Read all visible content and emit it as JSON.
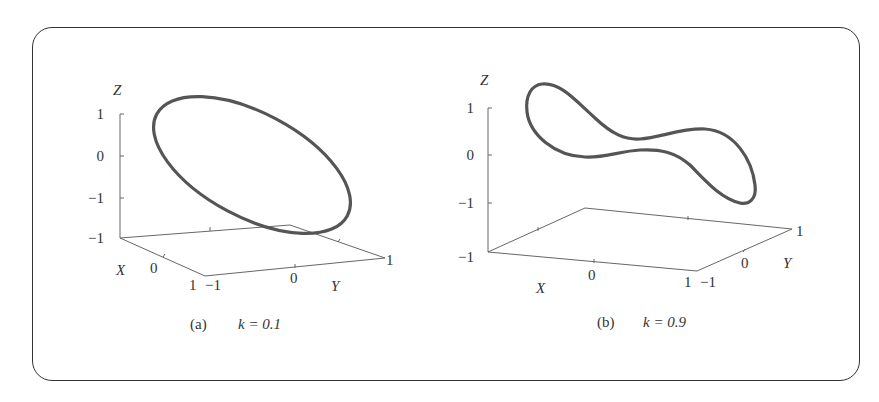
{
  "figure": {
    "panels": [
      {
        "id": "a",
        "caption_label": "(a)",
        "caption_param": "k = 0.1",
        "k": 0.1,
        "axes": {
          "x_label": "X",
          "y_label": "Y",
          "z_label": "Z",
          "z_ticks": [
            "1",
            "0",
            "−1",
            "−1"
          ],
          "x_ticks": [
            "0",
            "1"
          ],
          "y_ticks": [
            "−1",
            "0",
            "1"
          ]
        },
        "curve_shape": "ellipse"
      },
      {
        "id": "b",
        "caption_label": "(b)",
        "caption_param": "k = 0.9",
        "k": 0.9,
        "axes": {
          "x_label": "X",
          "y_label": "Y",
          "z_label": "Z",
          "z_ticks": [
            "1",
            "0",
            "−1",
            "−1"
          ],
          "x_ticks": [
            "0",
            "1"
          ],
          "y_ticks": [
            "−1",
            "0",
            "1"
          ]
        },
        "curve_shape": "saddle-loop"
      }
    ],
    "colors": {
      "curve": "#555555",
      "axis": "#666666",
      "frame": "#333333"
    }
  }
}
